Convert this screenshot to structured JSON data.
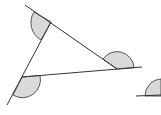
{
  "diagram": {
    "colors": {
      "line": "#333333",
      "shade": "#d9d9d9",
      "background": "#ffffff"
    },
    "lines": [
      {
        "name": "top-side-extended",
        "x1": 25,
        "y1": 5,
        "x2": 117,
        "y2": 69
      },
      {
        "name": "bottom-side-extended",
        "x1": 22,
        "y1": 77,
        "x2": 142,
        "y2": 67
      },
      {
        "name": "left-side-extended",
        "x1": 7,
        "y1": 105,
        "x2": 51,
        "y2": 22
      },
      {
        "name": "partial-line-right",
        "x1": 136,
        "y1": 96,
        "x2": 161,
        "y2": 95
      }
    ],
    "angles": [
      {
        "name": "exterior-angle-top-left"
      },
      {
        "name": "exterior-angle-right"
      },
      {
        "name": "exterior-angle-bottom-left"
      },
      {
        "name": "partial-angle-right-edge"
      }
    ]
  }
}
